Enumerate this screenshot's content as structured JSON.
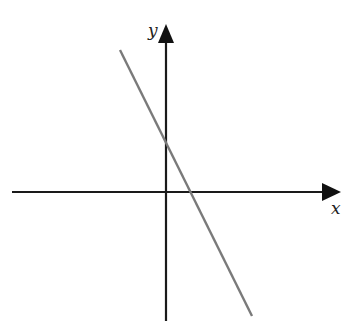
{
  "diagram": {
    "type": "coordinate-plane-line",
    "axes": {
      "x_label": "x",
      "y_label": "y",
      "color": "#1a1a1a"
    },
    "line": {
      "description": "straight line with negative slope and positive y-intercept",
      "slope_sign": "negative",
      "y_intercept_sign": "positive",
      "x_intercept_sign": "positive",
      "color": "#7a7a7a"
    }
  }
}
